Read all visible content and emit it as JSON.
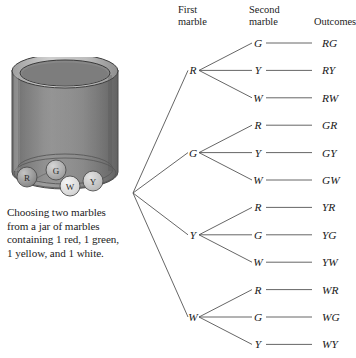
{
  "figure": {
    "title_caption_lines": [
      "Choosing two marbles",
      "from a jar of marbles",
      "containing 1 red, 1 green,",
      "1 yellow, and 1 white."
    ],
    "columns": {
      "first": "First\nmarble",
      "first_line1": "First",
      "first_line2": "marble",
      "second_line1": "Second",
      "second_line2": "marble",
      "outcomes": "Outcomes"
    }
  },
  "jar": {
    "marbles": [
      {
        "letter": "R",
        "name": "red-marble",
        "fill": "#8e8e8e"
      },
      {
        "letter": "G",
        "name": "green-marble",
        "fill": "#a8a8a8"
      },
      {
        "letter": "W",
        "name": "white-marble",
        "fill": "#e2e2e2"
      },
      {
        "letter": "Y",
        "name": "yellow-marble",
        "fill": "#c9c9c9"
      }
    ],
    "body_color": "#8d8d8d",
    "rim_color": "#b5b5b5",
    "shadow_color": "#6e6e6e"
  },
  "chart_data": {
    "type": "tree",
    "root_label": "",
    "level1_label": "First marble",
    "level2_label": "Second marble",
    "outcome_label": "Outcomes",
    "branches": [
      {
        "first": "R",
        "children": [
          {
            "second": "G",
            "outcome": "RG"
          },
          {
            "second": "Y",
            "outcome": "RY"
          },
          {
            "second": "W",
            "outcome": "RW"
          }
        ]
      },
      {
        "first": "G",
        "children": [
          {
            "second": "R",
            "outcome": "GR"
          },
          {
            "second": "Y",
            "outcome": "GY"
          },
          {
            "second": "W",
            "outcome": "GW"
          }
        ]
      },
      {
        "first": "Y",
        "children": [
          {
            "second": "R",
            "outcome": "YR"
          },
          {
            "second": "G",
            "outcome": "YG"
          },
          {
            "second": "W",
            "outcome": "YW"
          }
        ]
      },
      {
        "first": "W",
        "children": [
          {
            "second": "R",
            "outcome": "WR"
          },
          {
            "second": "G",
            "outcome": "WG"
          },
          {
            "second": "Y",
            "outcome": "WY"
          }
        ]
      }
    ],
    "total_outcomes": 12,
    "line_color": "#555555",
    "grid": false,
    "legend": "none"
  },
  "geometry": {
    "root_x": 133,
    "root_y": 193,
    "level1_x": 193,
    "level2_x": 258,
    "outcome_x": 322,
    "row_top": 43,
    "row_step": 27.4
  }
}
